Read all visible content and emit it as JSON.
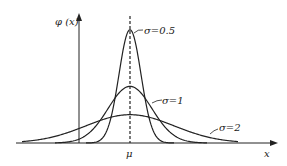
{
  "chart_data": {
    "type": "line",
    "title": "",
    "xlabel": "x",
    "ylabel": "φ (x)",
    "x_tick_labels": [
      "μ"
    ],
    "grid": false,
    "legend_position": "inline annotations",
    "annotations": [
      "σ=0.5",
      "σ=1",
      "σ=2"
    ],
    "mean_marker": "dashed vertical line at μ",
    "series": [
      {
        "name": "σ=0.5",
        "sigma": 0.5,
        "peak_relative": 0.798
      },
      {
        "name": "σ=1",
        "sigma": 1,
        "peak_relative": 0.399
      },
      {
        "name": "σ=2",
        "sigma": 2,
        "peak_relative": 0.199
      }
    ]
  },
  "labels": {
    "yaxis": "φ (x)",
    "xaxis": "x",
    "mu": "μ",
    "s05": "σ=0.5",
    "s1": "σ=1",
    "s2": "σ=2"
  }
}
